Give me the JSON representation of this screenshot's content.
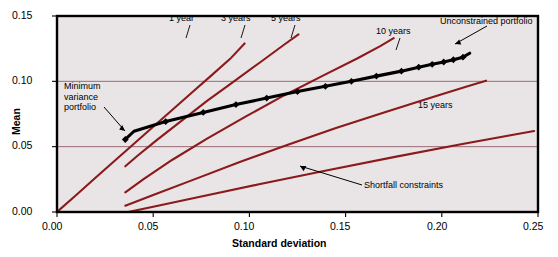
{
  "figure": {
    "width": 558,
    "height": 257,
    "background": "#ffffff",
    "plot_background": "#e9e4e5",
    "frame_color": "#000000",
    "grid_color": "#9a6a74",
    "curve_color": "#8b1a1a",
    "frontier_color": "#000000"
  },
  "axes": {
    "x_title": "Standard deviation",
    "y_title": "Mean",
    "x_ticks": [
      "0.00",
      "0.05",
      "0.10",
      "0.15",
      "0.20",
      "0.25"
    ],
    "y_ticks": [
      "0.00",
      "0.05",
      "0.10",
      "0.15"
    ]
  },
  "annotations": {
    "min_var": "Minimum\nvariance\nportfolio",
    "min_var_line1": "Minimum",
    "min_var_line2": "variance",
    "min_var_line3": "portfolio",
    "unconstrained": "Unconstrained portfolio",
    "shortfall": "Shortfall constraints"
  },
  "curve_labels": {
    "y1": "1 year",
    "y3": "3 years",
    "y5": "5 years",
    "y10": "10 years",
    "y15": "15 years"
  },
  "chart_data": {
    "type": "line",
    "title": "",
    "xlabel": "Standard deviation",
    "ylabel": "Mean",
    "xlim": [
      0.0,
      0.25
    ],
    "ylim": [
      0.0,
      0.15
    ],
    "xticks": [
      0.0,
      0.05,
      0.1,
      0.15,
      0.2,
      0.25
    ],
    "yticks": [
      0.0,
      0.05,
      0.1,
      0.15
    ],
    "grid": "horizontal gridlines at y=0.05 and y=0.10",
    "legend": "none (inline curve labels)",
    "series": [
      {
        "name": "Efficient frontier (unconstrained portfolio)",
        "style": "black thick line with diamond markers",
        "points": [
          [
            0.0355,
            0.0555
          ],
          [
            0.04,
            0.0618
          ],
          [
            0.0565,
            0.0692
          ],
          [
            0.076,
            0.0762
          ],
          [
            0.093,
            0.0822
          ],
          [
            0.109,
            0.0872
          ],
          [
            0.125,
            0.0922
          ],
          [
            0.1395,
            0.0962
          ],
          [
            0.153,
            0.1
          ],
          [
            0.166,
            0.104
          ],
          [
            0.179,
            0.1078
          ],
          [
            0.188,
            0.1108
          ],
          [
            0.195,
            0.113
          ],
          [
            0.201,
            0.1148
          ],
          [
            0.206,
            0.1165
          ],
          [
            0.211,
            0.1185
          ],
          [
            0.2145,
            0.1215
          ]
        ],
        "markers": [
          [
            0.0355,
            0.0555
          ],
          [
            0.0565,
            0.0692
          ],
          [
            0.076,
            0.0762
          ],
          [
            0.093,
            0.0822
          ],
          [
            0.109,
            0.0872
          ],
          [
            0.125,
            0.0922
          ],
          [
            0.1395,
            0.0962
          ],
          [
            0.153,
            0.1
          ],
          [
            0.166,
            0.104
          ],
          [
            0.179,
            0.1078
          ],
          [
            0.188,
            0.1108
          ],
          [
            0.195,
            0.113
          ],
          [
            0.201,
            0.1148
          ],
          [
            0.206,
            0.1165
          ],
          [
            0.211,
            0.1185
          ]
        ]
      },
      {
        "name": "1 year shortfall constraint",
        "style": "dark red line",
        "points": [
          [
            0.0,
            0.0
          ],
          [
            0.01,
            0.013
          ],
          [
            0.02,
            0.0262
          ],
          [
            0.03,
            0.0392
          ],
          [
            0.04,
            0.0522
          ],
          [
            0.05,
            0.0652
          ],
          [
            0.06,
            0.0782
          ],
          [
            0.07,
            0.0912
          ],
          [
            0.08,
            0.1042
          ],
          [
            0.09,
            0.1172
          ],
          [
            0.0975,
            0.129
          ]
        ]
      },
      {
        "name": "3 years shortfall constraint",
        "style": "dark red line",
        "points": [
          [
            0.0355,
            0.035
          ],
          [
            0.042,
            0.0432
          ],
          [
            0.052,
            0.0552
          ],
          [
            0.064,
            0.069
          ],
          [
            0.078,
            0.085
          ],
          [
            0.092,
            0.1
          ],
          [
            0.106,
            0.115
          ],
          [
            0.118,
            0.128
          ],
          [
            0.1255,
            0.136
          ]
        ]
      },
      {
        "name": "5 years shortfall constraint",
        "style": "dark red line",
        "points": [
          [
            0.0355,
            0.015
          ],
          [
            0.045,
            0.0252
          ],
          [
            0.06,
            0.04
          ],
          [
            0.078,
            0.0562
          ],
          [
            0.098,
            0.073
          ],
          [
            0.118,
            0.0892
          ],
          [
            0.138,
            0.1042
          ],
          [
            0.156,
            0.1175
          ],
          [
            0.168,
            0.127
          ],
          [
            0.175,
            0.133
          ]
        ]
      },
      {
        "name": "10 years shortfall constraint",
        "style": "dark red line",
        "points": [
          [
            0.0355,
            0.0048
          ],
          [
            0.05,
            0.013
          ],
          [
            0.07,
            0.0242
          ],
          [
            0.095,
            0.0382
          ],
          [
            0.12,
            0.0515
          ],
          [
            0.145,
            0.0642
          ],
          [
            0.17,
            0.0762
          ],
          [
            0.195,
            0.0878
          ],
          [
            0.213,
            0.096
          ],
          [
            0.223,
            0.1005
          ]
        ]
      },
      {
        "name": "15 years shortfall constraint",
        "style": "dark red line",
        "points": [
          [
            0.037,
            0.0
          ],
          [
            0.05,
            0.004
          ],
          [
            0.075,
            0.0118
          ],
          [
            0.105,
            0.0212
          ],
          [
            0.14,
            0.0318
          ],
          [
            0.175,
            0.042
          ],
          [
            0.21,
            0.0518
          ],
          [
            0.235,
            0.0585
          ],
          [
            0.248,
            0.062
          ]
        ]
      }
    ]
  }
}
